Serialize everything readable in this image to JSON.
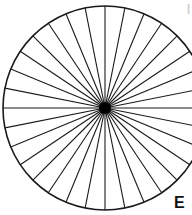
{
  "page": {
    "background_color": "#ffffff",
    "width": 192,
    "height": 215
  },
  "figure": {
    "name": "spoked-circle",
    "stroke_color": "#1a1a1a",
    "fill_color": "#ffffff",
    "hub_color": "#000000",
    "center_x": 105,
    "center_y": 108,
    "radius": 102,
    "outline_width": 1.6,
    "spoke_width": 1.1,
    "spoke_count": 32,
    "sector_angle_degrees": 11.25,
    "hub_radius": 6,
    "cropped_edge": "right"
  },
  "labels": {
    "figure_letter": "E",
    "corner_artifact": "|"
  },
  "chart_data": {
    "type": "pie",
    "title": "",
    "categories": [
      "1",
      "2",
      "3",
      "4",
      "5",
      "6",
      "7",
      "8",
      "9",
      "10",
      "11",
      "12",
      "13",
      "14",
      "15",
      "16",
      "17",
      "18",
      "19",
      "20",
      "21",
      "22",
      "23",
      "24",
      "25",
      "26",
      "27",
      "28",
      "29",
      "30",
      "31",
      "32"
    ],
    "values": [
      1,
      1,
      1,
      1,
      1,
      1,
      1,
      1,
      1,
      1,
      1,
      1,
      1,
      1,
      1,
      1,
      1,
      1,
      1,
      1,
      1,
      1,
      1,
      1,
      1,
      1,
      1,
      1,
      1,
      1,
      1,
      1
    ],
    "slice_angle_degrees": 11.25,
    "total_slices": 32,
    "legend": [],
    "grid": false,
    "xlabel": "",
    "ylabel": ""
  }
}
